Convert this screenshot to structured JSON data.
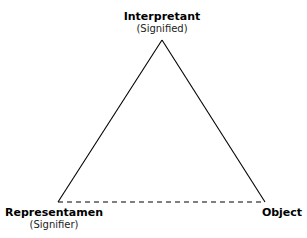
{
  "diagram": {
    "type": "semiotic-triangle",
    "nodes": {
      "top": {
        "title": "Interpretant",
        "subtitle": "(Signified)"
      },
      "left": {
        "title": "Representamen",
        "subtitle": "(Signifier)"
      },
      "right": {
        "title": "Object"
      }
    },
    "edges": [
      {
        "from": "left",
        "to": "top",
        "style": "solid"
      },
      {
        "from": "top",
        "to": "right",
        "style": "solid"
      },
      {
        "from": "left",
        "to": "right",
        "style": "dashed"
      }
    ],
    "colors": {
      "line": "#000000",
      "background": "#ffffff"
    }
  }
}
